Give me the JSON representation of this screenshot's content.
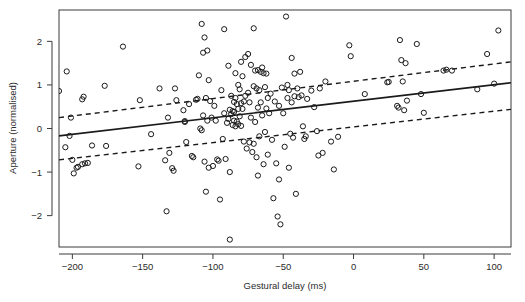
{
  "chart_data": {
    "type": "scatter",
    "title": "",
    "xlabel": "Gestural delay (ms)",
    "ylabel": "Aperture (normalised)",
    "xlim": [
      -209.5,
      112.0
    ],
    "ylim": [
      -2.72,
      2.72
    ],
    "xticks": [
      -200,
      -150,
      -100,
      -50,
      0,
      50,
      100
    ],
    "xtick_labels": [
      "−200",
      "−150",
      "−100",
      "−50",
      "0",
      "50",
      "100"
    ],
    "yticks": [
      -2,
      -1,
      0,
      1,
      2
    ],
    "ytick_labels": [
      "−2",
      "−1",
      "0",
      "1",
      "2"
    ],
    "grid": false,
    "legend": "none",
    "marker": "open-circle",
    "marker_color": "#1a1a1a",
    "series": [
      {
        "name": "observations",
        "points": [
          [
            -209.5,
            0.86
          ],
          [
            -205,
            -0.43
          ],
          [
            -204,
            1.31
          ],
          [
            -202,
            -0.17
          ],
          [
            -201,
            0.25
          ],
          [
            -200,
            -0.72
          ],
          [
            -199,
            -1.03
          ],
          [
            -197,
            -0.9
          ],
          [
            -196,
            -0.88
          ],
          [
            -193,
            0.67
          ],
          [
            -193,
            -0.82
          ],
          [
            -192,
            0.73
          ],
          [
            -191,
            -0.8
          ],
          [
            -189,
            -0.79
          ],
          [
            -186,
            -0.39
          ],
          [
            -177,
            0.98
          ],
          [
            -176,
            -0.4
          ],
          [
            -164,
            1.88
          ],
          [
            -153,
            -0.87
          ],
          [
            -152,
            0.65
          ],
          [
            -144,
            -0.13
          ],
          [
            -138,
            0.92
          ],
          [
            -134,
            -0.73
          ],
          [
            -133,
            -1.9
          ],
          [
            -132,
            0.25
          ],
          [
            -131,
            -0.56
          ],
          [
            -129,
            -0.91
          ],
          [
            -128,
            -0.97
          ],
          [
            -127,
            0.92
          ],
          [
            -126,
            0.65
          ],
          [
            -121,
            0.42
          ],
          [
            -120,
            0.15
          ],
          [
            -120,
            0.17
          ],
          [
            -119,
            -0.31
          ],
          [
            -117,
            0.56
          ],
          [
            -115,
            -0.63
          ],
          [
            -114,
            -0.66
          ],
          [
            -112,
            0.66
          ],
          [
            -111,
            0.68
          ],
          [
            -110,
            1.22
          ],
          [
            -109,
            0.0
          ],
          [
            -108,
            2.4
          ],
          [
            -108,
            -0.04
          ],
          [
            -107,
            1.74
          ],
          [
            -107,
            0.3
          ],
          [
            -106,
            2.09
          ],
          [
            -106,
            -0.76
          ],
          [
            -105,
            0.7
          ],
          [
            -105,
            -1.45
          ],
          [
            -104,
            1.79
          ],
          [
            -104,
            0.18
          ],
          [
            -103,
            1.11
          ],
          [
            -103,
            -0.9
          ],
          [
            -102,
            0.63
          ],
          [
            -101,
            0.25
          ],
          [
            -100,
            -0.86
          ],
          [
            -99,
            0.52
          ],
          [
            -98,
            0.18
          ],
          [
            -97,
            -0.71
          ],
          [
            -96,
            -0.74
          ],
          [
            -95,
            -1.63
          ],
          [
            -94,
            0.88
          ],
          [
            -93,
            -0.24
          ],
          [
            -92,
            2.28
          ],
          [
            -92,
            0.35
          ],
          [
            -91,
            -0.7
          ],
          [
            -90,
            0.13
          ],
          [
            -89,
            1.44
          ],
          [
            -89,
            0.22
          ],
          [
            -88,
            0.43
          ],
          [
            -88,
            -1.0
          ],
          [
            -88,
            -2.55
          ],
          [
            -87,
            0.75
          ],
          [
            -87,
            0.33
          ],
          [
            -86,
            0.4
          ],
          [
            -86,
            0.08
          ],
          [
            -85,
            0.61
          ],
          [
            -85,
            0.38
          ],
          [
            -85,
            0.18
          ],
          [
            -84,
            1.27
          ],
          [
            -84,
            0.7
          ],
          [
            -84,
            0.05
          ],
          [
            -83,
            0.56
          ],
          [
            -83,
            0.16
          ],
          [
            -82,
            1.0
          ],
          [
            -82,
            0.45
          ],
          [
            -82,
            0.1
          ],
          [
            -81,
            0.9
          ],
          [
            -81,
            0.28
          ],
          [
            -80,
            1.53
          ],
          [
            -80,
            0.58
          ],
          [
            -80,
            0.06
          ],
          [
            -79,
            1.2
          ],
          [
            -79,
            0.45
          ],
          [
            -78,
            0.62
          ],
          [
            -78,
            -0.3
          ],
          [
            -77,
            1.64
          ],
          [
            -77,
            0.75
          ],
          [
            -76,
            -0.46
          ],
          [
            -75,
            1.71
          ],
          [
            -75,
            0.82
          ],
          [
            -74,
            0.6
          ],
          [
            -74,
            -0.32
          ],
          [
            -73,
            1.46
          ],
          [
            -73,
            0.25
          ],
          [
            -72,
            -0.54
          ],
          [
            -71,
            2.3
          ],
          [
            -71,
            0.97
          ],
          [
            -71,
            -0.35
          ],
          [
            -70,
            1.33
          ],
          [
            -70,
            0.15
          ],
          [
            -69,
            0.92
          ],
          [
            -69,
            -0.66
          ],
          [
            -68,
            1.34
          ],
          [
            -68,
            0.48
          ],
          [
            -68,
            -1.08
          ],
          [
            -67,
            0.88
          ],
          [
            -67,
            -0.18
          ],
          [
            -66,
            1.3
          ],
          [
            -66,
            0.6
          ],
          [
            -65,
            1.4
          ],
          [
            -65,
            0.3
          ],
          [
            -64,
            1.27
          ],
          [
            -64,
            -0.82
          ],
          [
            -63,
            0.95
          ],
          [
            -63,
            -0.08
          ],
          [
            -62,
            1.26
          ],
          [
            -62,
            0.46
          ],
          [
            -61,
            0.7
          ],
          [
            -61,
            -0.6
          ],
          [
            -60,
            0.35
          ],
          [
            -59,
            0.8
          ],
          [
            -58,
            -0.26
          ],
          [
            -57,
            -1.6
          ],
          [
            -56,
            0.62
          ],
          [
            -55,
            -0.8
          ],
          [
            -54,
            -2.02
          ],
          [
            -53,
            0.52
          ],
          [
            -53,
            -1.17
          ],
          [
            -52,
            -2.2
          ],
          [
            -51,
            0.94
          ],
          [
            -50,
            0.35
          ],
          [
            -49,
            -0.42
          ],
          [
            -48,
            2.57
          ],
          [
            -47,
            1.0
          ],
          [
            -47,
            0.7
          ],
          [
            -46,
            0.88
          ],
          [
            -46,
            -0.9
          ],
          [
            -45,
            -0.12
          ],
          [
            -44,
            1.62
          ],
          [
            -44,
            0.6
          ],
          [
            -43,
            -0.21
          ],
          [
            -42,
            1.26
          ],
          [
            -42,
            0.74
          ],
          [
            -41,
            -1.5
          ],
          [
            -40,
            0.92
          ],
          [
            -39,
            0.72
          ],
          [
            -38,
            1.3
          ],
          [
            -37,
            0.76
          ],
          [
            -36,
            0.05
          ],
          [
            -35,
            -0.24
          ],
          [
            -34,
            -0.18
          ],
          [
            -33,
            0.68
          ],
          [
            -30,
            0.87
          ],
          [
            -28,
            0.49
          ],
          [
            -26,
            -0.06
          ],
          [
            -25,
            -0.62
          ],
          [
            -24,
            0.92
          ],
          [
            -22,
            -0.56
          ],
          [
            -20,
            1.08
          ],
          [
            -16,
            -0.3
          ],
          [
            -14,
            -0.94
          ],
          [
            -11,
            -0.19
          ],
          [
            8,
            0.79
          ],
          [
            24,
            1.06
          ],
          [
            25,
            1.07
          ],
          [
            31,
            0.52
          ],
          [
            32,
            0.48
          ],
          [
            33,
            2.03
          ],
          [
            34,
            1.57
          ],
          [
            35,
            1.08
          ],
          [
            36,
            0.42
          ],
          [
            37,
            1.5
          ],
          [
            38,
            0.64
          ],
          [
            45,
            1.94
          ],
          [
            48,
            0.79
          ],
          [
            50,
            0.36
          ],
          [
            64,
            1.33
          ],
          [
            66,
            1.35
          ],
          [
            70,
            1.33
          ],
          [
            88,
            0.9
          ],
          [
            95,
            1.71
          ],
          [
            100,
            1.03
          ],
          [
            103,
            2.25
          ],
          [
            -3,
            1.91
          ],
          [
            -2,
            1.66
          ]
        ]
      }
    ],
    "lines": [
      {
        "name": "regression-fit",
        "style": "solid",
        "x": [
          -209.5,
          112.0
        ],
        "y": [
          -0.17,
          1.05
        ]
      },
      {
        "name": "confidence-upper",
        "style": "dashed",
        "x": [
          -209.5,
          112.0
        ],
        "y": [
          0.25,
          1.53
        ]
      },
      {
        "name": "confidence-lower",
        "style": "dashed",
        "x": [
          -209.5,
          112.0
        ],
        "y": [
          -0.72,
          0.44
        ]
      }
    ]
  }
}
